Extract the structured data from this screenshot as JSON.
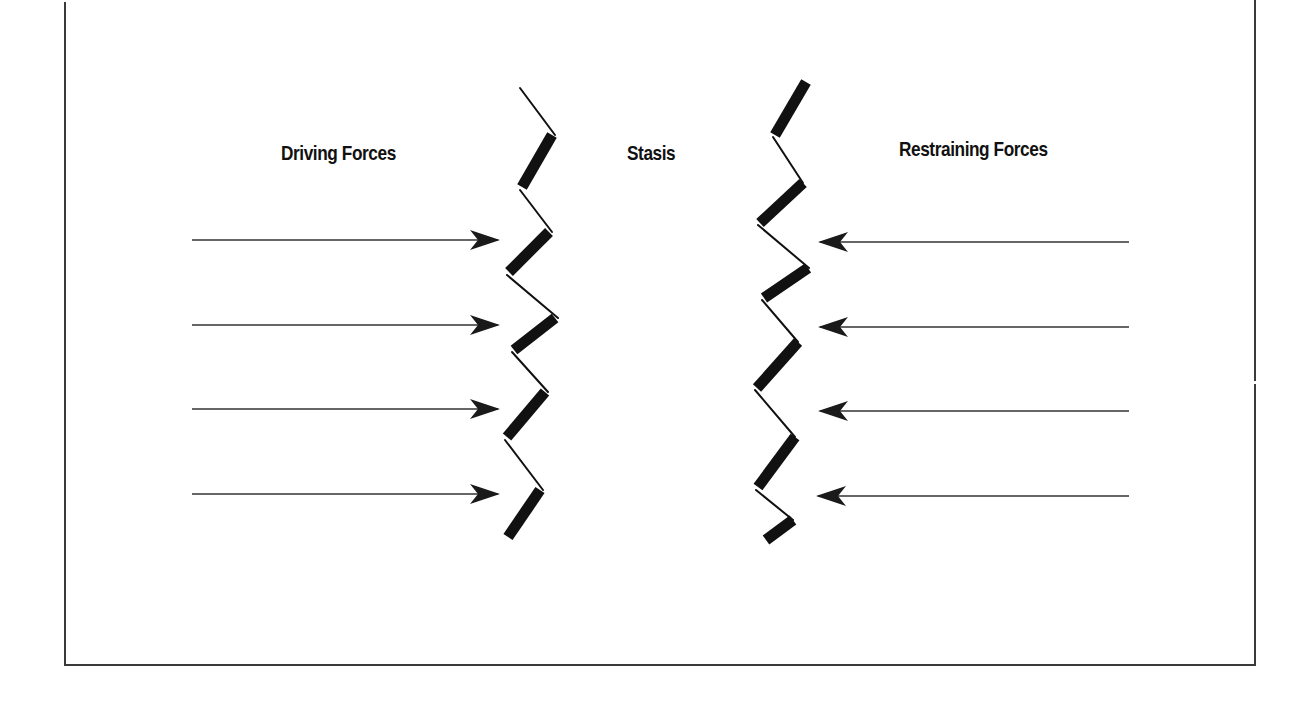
{
  "diagram": {
    "type": "force-field-analysis",
    "labels": {
      "left": "Driving Forces",
      "center": "Stasis",
      "right": "Restraining Forces"
    },
    "driving_forces": {
      "count": 4,
      "direction": "right",
      "arrows": [
        {
          "y": 240,
          "x_start": 192,
          "x_end": 498
        },
        {
          "y": 325,
          "x_start": 192,
          "x_end": 498
        },
        {
          "y": 409,
          "x_start": 192,
          "x_end": 498
        },
        {
          "y": 494,
          "x_start": 192,
          "x_end": 498
        }
      ]
    },
    "restraining_forces": {
      "count": 4,
      "direction": "left",
      "arrows": [
        {
          "y": 242,
          "x_start": 1129,
          "x_end": 820
        },
        {
          "y": 327,
          "x_start": 1129,
          "x_end": 820
        },
        {
          "y": 411,
          "x_start": 1129,
          "x_end": 820
        },
        {
          "y": 496,
          "x_start": 1129,
          "x_end": 818
        }
      ]
    },
    "colors": {
      "ink": "#111111",
      "frame": "#3a3a3a",
      "background": "#ffffff"
    }
  }
}
